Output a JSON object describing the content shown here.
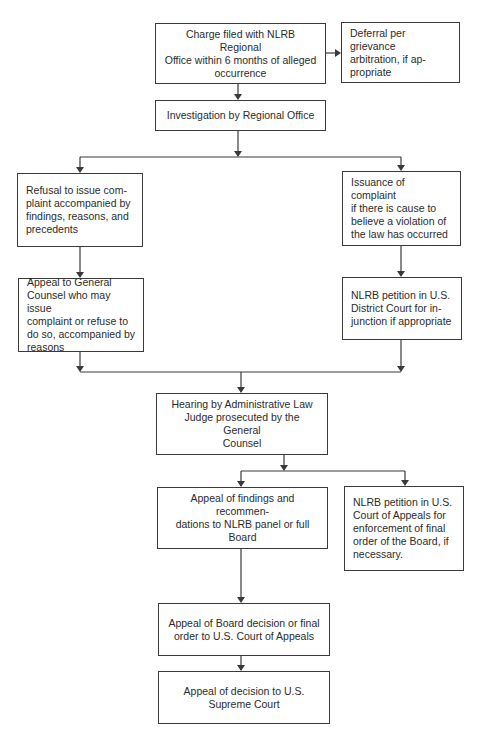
{
  "diagram": {
    "type": "flowchart",
    "colors": {
      "line": "#3a3a3a",
      "text": "#2b2b2b",
      "background": "#ffffff"
    },
    "nodes": {
      "charge": {
        "text": "Charge filed with NLRB Regional\nOffice within 6 months of alleged\noccurrence"
      },
      "deferral": {
        "text": "Deferral per grievance\narbitration, if ap-\npropriate"
      },
      "investigation": {
        "text": "Investigation by Regional Office"
      },
      "refusal": {
        "text": "Refusal to issue com-\nplaint accompanied by\nfindings, reasons, and\nprecedents"
      },
      "issuance": {
        "text": "Issuance of complaint\nif there is cause to\nbelieve a violation of\nthe law has occurred"
      },
      "appeal_gc": {
        "text": "Appeal to General\nCounsel who may issue\ncomplaint or refuse to\ndo so, accompanied by\nreasons"
      },
      "district_petition": {
        "text": "NLRB petition in U.S.\nDistrict Court for in-\njunction if appropriate"
      },
      "hearing": {
        "text": "Hearing by Administrative Law\nJudge prosecuted by the General\nCounsel"
      },
      "appeal_findings": {
        "text": "Appeal of findings and recommen-\ndations to NLRB panel or full\nBoard"
      },
      "appeals_petition": {
        "text": "NLRB petition in U.S.\nCourt of Appeals for\nenforcement of final\norder of the Board, if\nnecessary."
      },
      "board_appeal": {
        "text": "Appeal of Board decision or final\norder to U.S. Court of Appeals"
      },
      "supreme_appeal": {
        "text": "Appeal of decision to U.S.\nSupreme Court"
      }
    },
    "edges": [
      [
        "charge",
        "deferral"
      ],
      [
        "charge",
        "investigation"
      ],
      [
        "investigation",
        "refusal"
      ],
      [
        "investigation",
        "issuance"
      ],
      [
        "refusal",
        "appeal_gc"
      ],
      [
        "issuance",
        "district_petition"
      ],
      [
        "appeal_gc",
        "hearing"
      ],
      [
        "district_petition",
        "hearing"
      ],
      [
        "hearing",
        "appeal_findings"
      ],
      [
        "hearing",
        "appeals_petition"
      ],
      [
        "appeal_findings",
        "board_appeal"
      ],
      [
        "board_appeal",
        "supreme_appeal"
      ]
    ]
  }
}
